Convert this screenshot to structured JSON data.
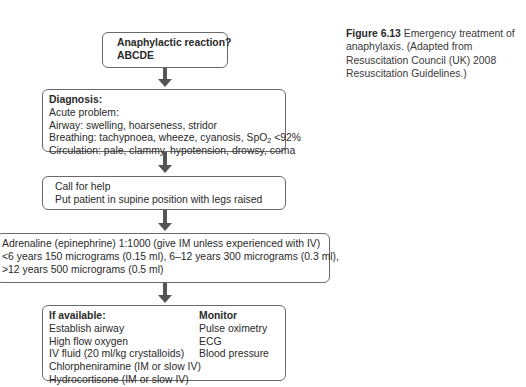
{
  "caption": {
    "label": "Figure 6.13",
    "text": " Emergency treatment of anaphylaxis. (Adapted from Resuscitation Council (UK) 2008 Resuscitation Guidelines.)"
  },
  "flowchart": {
    "box1": {
      "lines": [
        "Anaphylactic reaction?",
        "ABCDE"
      ]
    },
    "box2": {
      "title": "Diagnosis:",
      "lines": [
        "Acute problem:",
        "Airway: swelling, hoarseness, stridor"
      ],
      "breathing_prefix": "Breathing: tachypnoea, wheeze, cyanosis, SpO",
      "breathing_sub": "2",
      "breathing_suffix": " <92%",
      "circulation": "Circulation: pale, clammy, hypotension, drowsy, coma"
    },
    "box3": {
      "lines": [
        "Call for help",
        "Put patient in supine position with legs raised"
      ]
    },
    "box4": {
      "lines": [
        "Adrenaline (epinephrine) 1:1000 (give IM unless experienced with IV)",
        "<6 years 150 micrograms (0.15 ml), 6–12 years 300 micrograms (0.3 ml),",
        ">12 years 500 micrograms (0.5 ml)"
      ]
    },
    "box5": {
      "left_title": "If available:",
      "left_items": [
        "Establish airway",
        "High flow oxygen",
        "IV fluid (20 ml/kg crystalloids)",
        "Chlorpheniramine (IM or slow IV)",
        "Hydrocortisone (IM or slow IV)"
      ],
      "right_title": "Monitor",
      "right_items": [
        "Pulse oximetry",
        "ECG",
        "Blood pressure"
      ]
    }
  }
}
